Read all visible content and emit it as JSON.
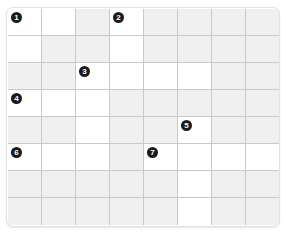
{
  "puzzle": {
    "title": "Crossword Grid",
    "columns": 8,
    "rows": 8,
    "colors": {
      "open_cell": "#ffffff",
      "blocked_cell": "#f0f0f0",
      "grid_line": "#c9c9c9",
      "frame_border": "#e2e2e2",
      "clue_marker_fill": "#1b1b1b",
      "clue_marker_text": "#ffffff",
      "page_background": "#ffffff"
    },
    "legend": {
      "open": "open",
      "blocked": "blocked"
    },
    "clue_numbers": [
      "1",
      "2",
      "3",
      "4",
      "5",
      "6",
      "7"
    ],
    "grid": [
      [
        {
          "state": "open",
          "number": "1"
        },
        {
          "state": "open",
          "number": ""
        },
        {
          "state": "blocked",
          "number": ""
        },
        {
          "state": "open",
          "number": "2"
        },
        {
          "state": "blocked",
          "number": ""
        },
        {
          "state": "blocked",
          "number": ""
        },
        {
          "state": "blocked",
          "number": ""
        },
        {
          "state": "blocked",
          "number": ""
        }
      ],
      [
        {
          "state": "open",
          "number": ""
        },
        {
          "state": "blocked",
          "number": ""
        },
        {
          "state": "blocked",
          "number": ""
        },
        {
          "state": "open",
          "number": ""
        },
        {
          "state": "blocked",
          "number": ""
        },
        {
          "state": "blocked",
          "number": ""
        },
        {
          "state": "blocked",
          "number": ""
        },
        {
          "state": "blocked",
          "number": ""
        }
      ],
      [
        {
          "state": "blocked",
          "number": ""
        },
        {
          "state": "blocked",
          "number": ""
        },
        {
          "state": "open",
          "number": "3"
        },
        {
          "state": "open",
          "number": ""
        },
        {
          "state": "open",
          "number": ""
        },
        {
          "state": "open",
          "number": ""
        },
        {
          "state": "blocked",
          "number": ""
        },
        {
          "state": "blocked",
          "number": ""
        }
      ],
      [
        {
          "state": "open",
          "number": "4"
        },
        {
          "state": "open",
          "number": ""
        },
        {
          "state": "open",
          "number": ""
        },
        {
          "state": "blocked",
          "number": ""
        },
        {
          "state": "blocked",
          "number": ""
        },
        {
          "state": "blocked",
          "number": ""
        },
        {
          "state": "blocked",
          "number": ""
        },
        {
          "state": "blocked",
          "number": ""
        }
      ],
      [
        {
          "state": "blocked",
          "number": ""
        },
        {
          "state": "blocked",
          "number": ""
        },
        {
          "state": "open",
          "number": ""
        },
        {
          "state": "blocked",
          "number": ""
        },
        {
          "state": "blocked",
          "number": ""
        },
        {
          "state": "open",
          "number": "5"
        },
        {
          "state": "blocked",
          "number": ""
        },
        {
          "state": "blocked",
          "number": ""
        }
      ],
      [
        {
          "state": "open",
          "number": "6"
        },
        {
          "state": "open",
          "number": ""
        },
        {
          "state": "open",
          "number": ""
        },
        {
          "state": "blocked",
          "number": ""
        },
        {
          "state": "open",
          "number": "7"
        },
        {
          "state": "open",
          "number": ""
        },
        {
          "state": "open",
          "number": ""
        },
        {
          "state": "open",
          "number": ""
        }
      ],
      [
        {
          "state": "blocked",
          "number": ""
        },
        {
          "state": "blocked",
          "number": ""
        },
        {
          "state": "blocked",
          "number": ""
        },
        {
          "state": "blocked",
          "number": ""
        },
        {
          "state": "blocked",
          "number": ""
        },
        {
          "state": "open",
          "number": ""
        },
        {
          "state": "blocked",
          "number": ""
        },
        {
          "state": "blocked",
          "number": ""
        }
      ],
      [
        {
          "state": "blocked",
          "number": ""
        },
        {
          "state": "blocked",
          "number": ""
        },
        {
          "state": "blocked",
          "number": ""
        },
        {
          "state": "blocked",
          "number": ""
        },
        {
          "state": "blocked",
          "number": ""
        },
        {
          "state": "open",
          "number": ""
        },
        {
          "state": "blocked",
          "number": ""
        },
        {
          "state": "blocked",
          "number": ""
        }
      ]
    ]
  }
}
